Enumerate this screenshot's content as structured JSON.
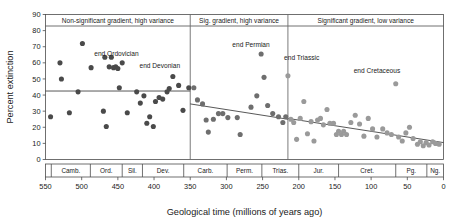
{
  "figure": {
    "background": "#ffffff",
    "axis_title_x": "Geological time (millions of years ago)",
    "axis_title_y": "Percent extinction"
  },
  "chart_data": {
    "type": "scatter",
    "title": "",
    "xlabel": "Geological time (millions of years ago)",
    "ylabel": "Percent extinction",
    "xlim": [
      550,
      0
    ],
    "ylim": [
      0,
      90
    ],
    "x_reversed": true,
    "grid": false,
    "legend": null,
    "xticks": [
      550,
      500,
      450,
      400,
      350,
      300,
      250,
      200,
      150,
      100,
      50,
      0
    ],
    "yticks": [
      0,
      10,
      20,
      30,
      40,
      50,
      60,
      70,
      80,
      90
    ],
    "panels": [
      {
        "id": "panel-1",
        "label": "Non-significant gradient, high variance",
        "x_start": 550,
        "x_end": 350,
        "trend": {
          "x1": 550,
          "y1": 42.5,
          "x2": 350,
          "y2": 42.5
        },
        "marker_color": "#4a4a4a"
      },
      {
        "id": "panel-2",
        "label": "Sig. gradient, high variance",
        "x_start": 350,
        "x_end": 215,
        "trend": {
          "x1": 350,
          "y1": 34.5,
          "x2": 215,
          "y2": 25.0
        },
        "marker_color": "#6e6e6e"
      },
      {
        "id": "panel-3",
        "label": "Significant gradient, low variance",
        "x_start": 215,
        "x_end": 0,
        "trend": {
          "x1": 215,
          "y1": 25.5,
          "x2": 0,
          "y2": 10.5
        },
        "marker_color": "#9a9a9a"
      }
    ],
    "periods": [
      {
        "name": "Camb.",
        "start": 542,
        "end": 488
      },
      {
        "name": "Ord.",
        "start": 488,
        "end": 444
      },
      {
        "name": "Sil.",
        "start": 444,
        "end": 416
      },
      {
        "name": "Dev.",
        "start": 416,
        "end": 359
      },
      {
        "name": "Carb.",
        "start": 359,
        "end": 299
      },
      {
        "name": "Perm.",
        "start": 299,
        "end": 251
      },
      {
        "name": "Trias.",
        "start": 251,
        "end": 200
      },
      {
        "name": "Jur.",
        "start": 200,
        "end": 145
      },
      {
        "name": "Cret.",
        "start": 145,
        "end": 66
      },
      {
        "name": "Pg.",
        "start": 66,
        "end": 23
      },
      {
        "name": "Ng.",
        "start": 23,
        "end": 0
      }
    ],
    "annotations": [
      {
        "text": "end Ordovician",
        "x": 452,
        "y": 64.5,
        "point_x": 444,
        "point_y": 60.0
      },
      {
        "text": "end Devonian",
        "x": 392,
        "y": 56.5,
        "point_x": 374,
        "point_y": 51.5
      },
      {
        "text": "end Permian",
        "x": 266,
        "y": 70.0,
        "point_x": 252,
        "point_y": 65.5
      },
      {
        "text": "end Triassic",
        "x": 196,
        "y": 62.0,
        "point_x": 215,
        "point_y": 52.0
      },
      {
        "text": "end Cretaceous",
        "x": 92,
        "y": 53.5,
        "point_x": 66,
        "point_y": 47.0
      }
    ],
    "series": [
      {
        "name": "Cambrian-Devonian extinctions",
        "panel": "panel-1",
        "color": "#4a4a4a",
        "points": [
          {
            "x": 543,
            "y": 26.5
          },
          {
            "x": 530,
            "y": 60.0
          },
          {
            "x": 528,
            "y": 50.0
          },
          {
            "x": 517,
            "y": 29.0
          },
          {
            "x": 505,
            "y": 42.0
          },
          {
            "x": 499,
            "y": 72.0
          },
          {
            "x": 487,
            "y": 57.0
          },
          {
            "x": 470,
            "y": 30.0
          },
          {
            "x": 468,
            "y": 63.5
          },
          {
            "x": 466,
            "y": 20.5
          },
          {
            "x": 462,
            "y": 57.5
          },
          {
            "x": 459,
            "y": 63.5
          },
          {
            "x": 456,
            "y": 57.0
          },
          {
            "x": 453,
            "y": 57.5
          },
          {
            "x": 450,
            "y": 56.5
          },
          {
            "x": 448,
            "y": 44.5
          },
          {
            "x": 444,
            "y": 60.0
          },
          {
            "x": 437,
            "y": 29.0
          },
          {
            "x": 424,
            "y": 42.0
          },
          {
            "x": 419,
            "y": 35.0
          },
          {
            "x": 414,
            "y": 39.5
          },
          {
            "x": 410,
            "y": 22.5
          },
          {
            "x": 406,
            "y": 26.5
          },
          {
            "x": 401,
            "y": 20.5
          },
          {
            "x": 398,
            "y": 36.0
          },
          {
            "x": 393,
            "y": 38.5
          },
          {
            "x": 388,
            "y": 37.5
          },
          {
            "x": 382,
            "y": 42.0
          },
          {
            "x": 379,
            "y": 44.0
          },
          {
            "x": 374,
            "y": 51.5
          },
          {
            "x": 366,
            "y": 46.0
          },
          {
            "x": 360,
            "y": 30.5
          },
          {
            "x": 352,
            "y": 44.5
          }
        ]
      },
      {
        "name": "Carboniferous-Triassic extinctions",
        "panel": "panel-2",
        "color": "#6e6e6e",
        "points": [
          {
            "x": 345,
            "y": 44.5
          },
          {
            "x": 340,
            "y": 37.0
          },
          {
            "x": 333,
            "y": 34.5
          },
          {
            "x": 328,
            "y": 24.5
          },
          {
            "x": 325,
            "y": 17.0
          },
          {
            "x": 318,
            "y": 25.0
          },
          {
            "x": 311,
            "y": 28.5
          },
          {
            "x": 305,
            "y": 28.5
          },
          {
            "x": 298,
            "y": 26.0
          },
          {
            "x": 285,
            "y": 26.0
          },
          {
            "x": 281,
            "y": 15.5
          },
          {
            "x": 266,
            "y": 32.5
          },
          {
            "x": 258,
            "y": 39.5
          },
          {
            "x": 252,
            "y": 65.5
          },
          {
            "x": 248,
            "y": 51.0
          },
          {
            "x": 243,
            "y": 33.5
          },
          {
            "x": 236,
            "y": 28.5
          },
          {
            "x": 228,
            "y": 26.5
          },
          {
            "x": 222,
            "y": 23.0
          },
          {
            "x": 218,
            "y": 26.5
          }
        ]
      },
      {
        "name": "Jurassic-Neogene extinctions",
        "panel": "panel-3",
        "color": "#9a9a9a",
        "points": [
          {
            "x": 215,
            "y": 52.0
          },
          {
            "x": 211,
            "y": 25.0
          },
          {
            "x": 207,
            "y": 23.0
          },
          {
            "x": 203,
            "y": 12.5
          },
          {
            "x": 198,
            "y": 25.5
          },
          {
            "x": 193,
            "y": 36.0
          },
          {
            "x": 188,
            "y": 16.0
          },
          {
            "x": 183,
            "y": 23.5
          },
          {
            "x": 179,
            "y": 11.5
          },
          {
            "x": 174,
            "y": 24.5
          },
          {
            "x": 170,
            "y": 25.5
          },
          {
            "x": 166,
            "y": 21.5
          },
          {
            "x": 161,
            "y": 31.0
          },
          {
            "x": 157,
            "y": 22.5
          },
          {
            "x": 152,
            "y": 22.5
          },
          {
            "x": 148,
            "y": 15.5
          },
          {
            "x": 145,
            "y": 17.5
          },
          {
            "x": 141,
            "y": 15.5
          },
          {
            "x": 138,
            "y": 17.5
          },
          {
            "x": 134,
            "y": 15.5
          },
          {
            "x": 128,
            "y": 23.0
          },
          {
            "x": 122,
            "y": 27.5
          },
          {
            "x": 116,
            "y": 22.0
          },
          {
            "x": 110,
            "y": 14.5
          },
          {
            "x": 104,
            "y": 25.5
          },
          {
            "x": 98,
            "y": 19.0
          },
          {
            "x": 92,
            "y": 14.0
          },
          {
            "x": 84,
            "y": 19.0
          },
          {
            "x": 78,
            "y": 16.5
          },
          {
            "x": 72,
            "y": 15.5
          },
          {
            "x": 66,
            "y": 47.0
          },
          {
            "x": 62,
            "y": 14.0
          },
          {
            "x": 57,
            "y": 11.5
          },
          {
            "x": 52,
            "y": 16.5
          },
          {
            "x": 47,
            "y": 20.0
          },
          {
            "x": 42,
            "y": 13.0
          },
          {
            "x": 36,
            "y": 9.5
          },
          {
            "x": 32,
            "y": 11.0
          },
          {
            "x": 28,
            "y": 8.5
          },
          {
            "x": 24,
            "y": 10.5
          },
          {
            "x": 20,
            "y": 9.0
          },
          {
            "x": 15,
            "y": 11.0
          },
          {
            "x": 11,
            "y": 10.0
          },
          {
            "x": 6,
            "y": 9.5
          }
        ]
      }
    ]
  }
}
